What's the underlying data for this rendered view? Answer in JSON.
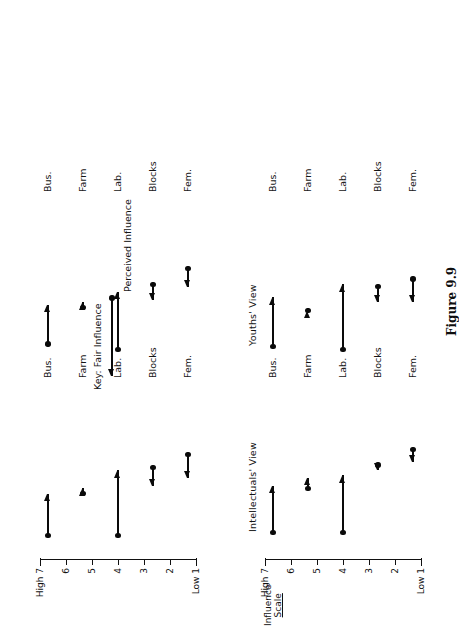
{
  "figure": {
    "caption": "Figure 9.9",
    "scale_title_line1": "Influence",
    "scale_title_line2": "Scale"
  },
  "axis": {
    "high_label": "High 7",
    "low_label": "Low 1",
    "ticks": [
      {
        "value": 7,
        "label": "High 7"
      },
      {
        "value": 6,
        "label": "6"
      },
      {
        "value": 5,
        "label": "5"
      },
      {
        "value": 4,
        "label": "4"
      },
      {
        "value": 3,
        "label": "3"
      },
      {
        "value": 2,
        "label": "2"
      },
      {
        "value": 1,
        "label": "Low 1"
      }
    ],
    "min": 1,
    "max": 7
  },
  "categories": [
    "Bus.",
    "Farm",
    "Lab.",
    "Blocks",
    "Fem."
  ],
  "key": {
    "title": "Key:",
    "arrow_end_label": "Fair Influence",
    "dot_end_label": "Perceived Influence"
  },
  "chart_data": {
    "type": "scatter",
    "title": "Figure 9.9",
    "xlabel": "",
    "ylabel": "Influence Scale",
    "ylim": [
      1,
      7
    ],
    "grid": false,
    "legend": [
      "Perceived Influence (dot)",
      "Fair Influence (arrowhead)"
    ],
    "categories": [
      "Bus.",
      "Farm",
      "Lab.",
      "Blocks",
      "Fem."
    ],
    "panels": [
      {
        "name": "Intellectuals' View",
        "points": [
          {
            "category": "Bus.",
            "perceived": 6.1,
            "fair": 4.3
          },
          {
            "category": "Farm",
            "perceived": 4.4,
            "fair": 4.0
          },
          {
            "category": "Lab.",
            "perceived": 6.1,
            "fair": 3.9
          },
          {
            "category": "Blocks",
            "perceived": 3.5,
            "fair": 3.7
          },
          {
            "category": "Fem.",
            "perceived": 2.9,
            "fair": 3.4
          }
        ]
      },
      {
        "name": "Youths' View",
        "points": [
          {
            "category": "Bus.",
            "perceived": 6.1,
            "fair": 4.2
          },
          {
            "category": "Farm",
            "perceived": 4.7,
            "fair": 4.7
          },
          {
            "category": "Lab.",
            "perceived": 6.2,
            "fair": 3.7
          },
          {
            "category": "Blocks",
            "perceived": 3.8,
            "fair": 4.4
          },
          {
            "category": "Fem.",
            "perceived": 3.5,
            "fair": 4.4
          }
        ]
      },
      {
        "name": "",
        "points": [
          {
            "category": "Bus.",
            "perceived": 6.2,
            "fair": 4.6
          },
          {
            "category": "Farm",
            "perceived": 4.6,
            "fair": 4.4
          },
          {
            "category": "Lab.",
            "perceived": 6.2,
            "fair": 3.7
          },
          {
            "category": "Blocks",
            "perceived": 3.6,
            "fair": 4.3
          },
          {
            "category": "Fem.",
            "perceived": 3.1,
            "fair": 4.0
          }
        ]
      },
      {
        "name": "",
        "points": [
          {
            "category": "Bus.",
            "perceived": 6.0,
            "fair": 4.5
          },
          {
            "category": "Farm",
            "perceived": 4.6,
            "fair": 4.4
          },
          {
            "category": "Lab.",
            "perceived": 6.2,
            "fair": 4.0
          },
          {
            "category": "Blocks",
            "perceived": 3.7,
            "fair": 4.3
          },
          {
            "category": "Fem.",
            "perceived": 3.1,
            "fair": 3.8
          }
        ]
      }
    ]
  }
}
